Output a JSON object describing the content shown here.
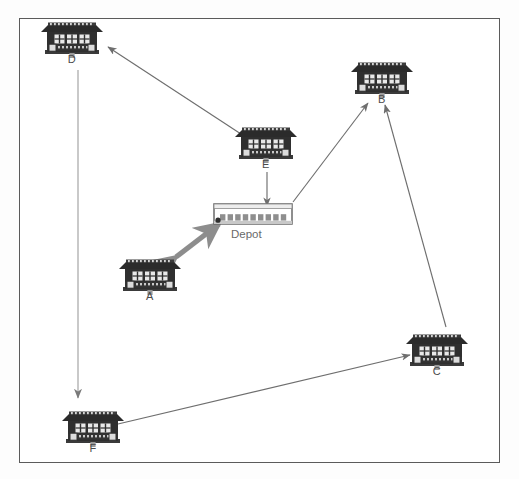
{
  "diagram": {
    "frame": {
      "border_color": "#5b5b5b",
      "background": "#ffffff"
    },
    "palette": {
      "building_dark": "#2b2b2b",
      "building_mid": "#4a4a4a",
      "building_light": "#d8d8d8",
      "arrow_thin": "#6e6e6e",
      "arrow_thick": "#8a8a8a",
      "depot_outline": "#6a6a6a",
      "label_text": "#4a4a4a"
    },
    "nodes": [
      {
        "id": "D",
        "label": "D",
        "type": "factory-building",
        "x": 72,
        "y": 40,
        "label_x": 72,
        "label_y": 60
      },
      {
        "id": "B",
        "label": "B",
        "type": "factory-building",
        "x": 382,
        "y": 80,
        "label_x": 382,
        "label_y": 100
      },
      {
        "id": "E",
        "label": "E",
        "type": "factory-building",
        "x": 266,
        "y": 145,
        "label_x": 266,
        "label_y": 165
      },
      {
        "id": "Depot",
        "label": "Depot",
        "type": "depot-building",
        "x": 253,
        "y": 214,
        "label_x": 253,
        "label_y": 237
      },
      {
        "id": "A",
        "label": "A",
        "type": "factory-building",
        "x": 150,
        "y": 277,
        "label_x": 150,
        "label_y": 298
      },
      {
        "id": "C",
        "label": "C",
        "type": "factory-building",
        "x": 437,
        "y": 352,
        "label_x": 437,
        "label_y": 372
      },
      {
        "id": "F",
        "label": "F",
        "type": "factory-building",
        "x": 93,
        "y": 429,
        "label_x": 93,
        "label_y": 450
      }
    ],
    "edges": [
      {
        "id": "e-d",
        "from": "E",
        "to": "D",
        "style": "thin-arrow",
        "direction": "one-way"
      },
      {
        "id": "d-f",
        "from": "D",
        "to": "F",
        "style": "thin-arrow",
        "direction": "one-way"
      },
      {
        "id": "e-depot",
        "from": "E",
        "to": "Depot",
        "style": "thin-arrow",
        "direction": "one-way"
      },
      {
        "id": "a-depot",
        "from": "A",
        "to": "Depot",
        "style": "thick-arrow",
        "direction": "two-way"
      },
      {
        "id": "depot-b",
        "from": "Depot",
        "to": "B",
        "style": "thin-arrow",
        "direction": "one-way"
      },
      {
        "id": "c-b",
        "from": "C",
        "to": "B",
        "style": "thin-arrow",
        "direction": "one-way"
      },
      {
        "id": "f-c",
        "from": "F",
        "to": "C",
        "style": "thin-arrow",
        "direction": "one-way"
      }
    ]
  }
}
